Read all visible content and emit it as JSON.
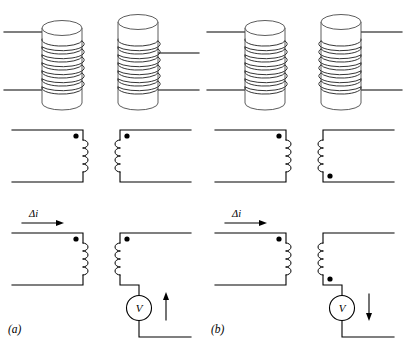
{
  "figure": {
    "background_color": "#ffffff",
    "line_color": "#000000",
    "cylinder_color": "#4a4a4a",
    "width": 406,
    "height": 347,
    "panels": [
      {
        "id": "a",
        "label": "(a)",
        "rows": [
          {
            "name": "pictorial-coils",
            "description": "Two solenoids wound on cylinders",
            "left_coil": {
              "turns": 7,
              "lead_top_side": "left",
              "lead_bottom_side": "left",
              "winding_sense": "same"
            },
            "right_coil": {
              "turns": 7,
              "lead_top_side": "right",
              "lead_bottom_side": "right",
              "winding_sense": "same"
            }
          },
          {
            "name": "schematic-dots",
            "description": "Schematic with dot convention markers",
            "left_inductor": {
              "loops": 4,
              "dot_position": "top"
            },
            "right_inductor": {
              "loops": 4,
              "dot_position": "top"
            }
          },
          {
            "name": "schematic-meter",
            "description": "Circuit with current change and voltmeter",
            "current_label": "Δi",
            "current_direction": "right",
            "left_inductor": {
              "loops": 4,
              "dot_position": "top"
            },
            "right_inductor": {
              "loops": 4,
              "dot_position": "top"
            },
            "meter_label": "V",
            "meter_arrow_direction": "up"
          }
        ]
      },
      {
        "id": "b",
        "label": "(b)",
        "rows": [
          {
            "name": "pictorial-coils",
            "description": "Two solenoids wound on cylinders, opposite sense",
            "left_coil": {
              "turns": 7,
              "lead_top_side": "left",
              "lead_bottom_side": "left",
              "winding_sense": "same"
            },
            "right_coil": {
              "turns": 7,
              "lead_top_side": "right",
              "lead_bottom_side": "right",
              "winding_sense": "opposite"
            }
          },
          {
            "name": "schematic-dots",
            "description": "Schematic with dot convention markers",
            "left_inductor": {
              "loops": 4,
              "dot_position": "top"
            },
            "right_inductor": {
              "loops": 4,
              "dot_position": "bottom"
            }
          },
          {
            "name": "schematic-meter",
            "description": "Circuit with current change and voltmeter",
            "current_label": "Δi",
            "current_direction": "right",
            "left_inductor": {
              "loops": 4,
              "dot_position": "top"
            },
            "right_inductor": {
              "loops": 4,
              "dot_position": "bottom"
            },
            "meter_label": "V",
            "meter_arrow_direction": "down"
          }
        ]
      }
    ]
  }
}
